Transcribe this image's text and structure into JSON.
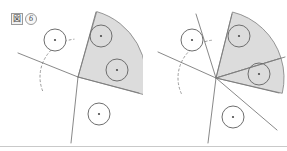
{
  "document": {
    "title": "Geometric sector figures",
    "background_color": "#ffffff",
    "width": 287,
    "height": 151
  },
  "style": {
    "line_color": "#7b7b7b",
    "line_width": 0.9,
    "shaded_fill": "#dcdcdc",
    "shaded_stroke": "#8a8a8a",
    "circle_stroke": "#6e6e6e",
    "circle_fill": "#ffffff",
    "dot_color": "#4a4a4a",
    "dashed_color": "#9b9b9b",
    "rule_color": "#c9c9c9"
  },
  "panels": [
    {
      "id": "fig6",
      "label": {
        "glyph": "図",
        "number": "6",
        "full": "図 6"
      },
      "vertex": {
        "x": 78,
        "y": 77
      },
      "lines": [
        {
          "name": "upper-left-ray",
          "x1": 78,
          "y1": 77,
          "x2": 18,
          "y2": 53
        },
        {
          "name": "lower-vertical-ray",
          "x1": 78,
          "y1": 77,
          "x2": 71,
          "y2": 143
        },
        {
          "name": "sector-upper-edge",
          "x1": 78,
          "y1": 77,
          "x2": 96,
          "y2": 12
        },
        {
          "name": "sector-lower-edge",
          "x1": 78,
          "y1": 77,
          "x2": 139,
          "y2": 93
        }
      ],
      "shaded_sectors": [
        {
          "name": "single-shaded-sector",
          "center": {
            "x": 78,
            "y": 77
          },
          "radius": 68,
          "start_angle_deg": -74,
          "end_angle_deg": 15
        }
      ],
      "dashed_arc": {
        "name": "angle-arc",
        "center": {
          "x": 78,
          "y": 77
        },
        "radius": 38,
        "start_angle_deg": 159,
        "end_angle_deg": 264
      },
      "circles": [
        {
          "name": "circle-upper-left",
          "cx": 55,
          "cy": 40,
          "r": 11,
          "shaded": false
        },
        {
          "name": "circle-sector-upper",
          "cx": 101,
          "cy": 36,
          "r": 11,
          "shaded": true
        },
        {
          "name": "circle-sector-lower",
          "cx": 117,
          "cy": 70,
          "r": 11,
          "shaded": true
        },
        {
          "name": "circle-lower",
          "cx": 99,
          "cy": 114,
          "r": 11,
          "shaded": false
        }
      ]
    },
    {
      "id": "fig7",
      "label": {
        "glyph": "図",
        "number": "7",
        "full": "図 7"
      },
      "vertex": {
        "x": 216,
        "y": 78
      },
      "lines": [
        {
          "name": "upper-left-ray",
          "x1": 216,
          "y1": 78,
          "x2": 158,
          "y2": 52
        },
        {
          "name": "steep-upper-ray",
          "x1": 216,
          "y1": 78,
          "x2": 196,
          "y2": 14
        },
        {
          "name": "lower-vertical-ray",
          "x1": 216,
          "y1": 78,
          "x2": 208,
          "y2": 143
        },
        {
          "name": "lower-right-ray",
          "x1": 216,
          "y1": 78,
          "x2": 277,
          "y2": 130
        },
        {
          "name": "sector-upper-edge",
          "x1": 216,
          "y1": 78,
          "x2": 232,
          "y2": 14
        },
        {
          "name": "sector-divider",
          "x1": 216,
          "y1": 78,
          "x2": 285,
          "y2": 57
        },
        {
          "name": "sector-lower-edge",
          "x1": 216,
          "y1": 78,
          "x2": 279,
          "y2": 93
        }
      ],
      "shaded_sectors": [
        {
          "name": "upper-shaded-subsector",
          "center": {
            "x": 216,
            "y": 78
          },
          "radius": 68,
          "start_angle_deg": -76,
          "end_angle_deg": -17
        },
        {
          "name": "lower-shaded-subsector",
          "center": {
            "x": 216,
            "y": 78
          },
          "radius": 68,
          "start_angle_deg": -17,
          "end_angle_deg": 13
        }
      ],
      "dashed_arc": {
        "name": "angle-arc",
        "center": {
          "x": 216,
          "y": 78
        },
        "radius": 38,
        "start_angle_deg": 156,
        "end_angle_deg": 263
      },
      "circles": [
        {
          "name": "circle-upper-left",
          "cx": 192,
          "cy": 40,
          "r": 11,
          "shaded": false
        },
        {
          "name": "circle-sector-upper",
          "cx": 239,
          "cy": 36,
          "r": 11,
          "shaded": true
        },
        {
          "name": "circle-sector-lower",
          "cx": 259,
          "cy": 74,
          "r": 11,
          "shaded": true
        },
        {
          "name": "circle-lower",
          "cx": 233,
          "cy": 117,
          "r": 11,
          "shaded": false
        }
      ]
    }
  ]
}
